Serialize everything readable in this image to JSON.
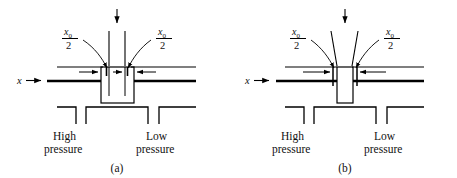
{
  "figure": {
    "type": "engineering-schematic",
    "background_color": "#ffffff",
    "line_color": "#000000"
  },
  "panels": [
    {
      "id": "a",
      "caption": "(a)",
      "labels": {
        "axis": "x",
        "axis_arrow": "→",
        "left_annotation": {
          "numerator": "x",
          "subscript": "0",
          "denominator": "2"
        },
        "right_annotation": {
          "numerator": "x",
          "subscript": "0",
          "denominator": "2"
        },
        "high_pressure_line1": "High",
        "high_pressure_line2": "pressure",
        "low_pressure_line1": "Low",
        "low_pressure_line2": "pressure"
      }
    },
    {
      "id": "b",
      "caption": "(b)",
      "labels": {
        "axis": "x",
        "axis_arrow": "→",
        "left_annotation": {
          "numerator": "x",
          "subscript": "0",
          "denominator": "2"
        },
        "right_annotation": {
          "numerator": "x",
          "subscript": "0",
          "denominator": "2"
        },
        "high_pressure_line1": "High",
        "high_pressure_line2": "pressure",
        "low_pressure_line1": "Low",
        "low_pressure_line2": "pressure"
      }
    }
  ]
}
